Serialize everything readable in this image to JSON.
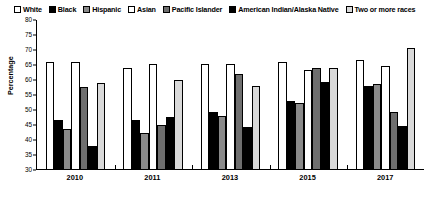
{
  "chart_data": {
    "type": "bar",
    "title": "",
    "xlabel": "",
    "ylabel": "Percentage",
    "ylim": [
      30,
      80
    ],
    "ytick_step": 5,
    "yticks": [
      30,
      35,
      40,
      45,
      50,
      55,
      60,
      65,
      70,
      75,
      80
    ],
    "grid": false,
    "legend_position": "top",
    "categories": [
      "2010",
      "2011",
      "2013",
      "2015",
      "2017"
    ],
    "series": [
      {
        "name": "White",
        "pattern": "open-white",
        "values": [
          65.8,
          63.8,
          64.9,
          65.8,
          66.4
        ]
      },
      {
        "name": "Black",
        "pattern": "solid-black",
        "values": [
          46.2,
          46.4,
          48.9,
          52.6,
          57.8
        ]
      },
      {
        "name": "Hispanic",
        "pattern": "solid-gray",
        "values": [
          43.3,
          42.1,
          47.8,
          52.1,
          58.5
        ]
      },
      {
        "name": "Asian",
        "pattern": "dotted-light",
        "values": [
          65.7,
          65.1,
          65.0,
          62.9,
          64.3
        ]
      },
      {
        "name": "Pacific Islander",
        "pattern": "dotted-dark",
        "values": [
          57.2,
          44.8,
          61.6,
          63.6,
          49.0
        ]
      },
      {
        "name": "American Indian/Alaska Native",
        "pattern": "solid-black",
        "values": [
          37.7,
          47.4,
          44.1,
          59.0,
          44.5
        ]
      },
      {
        "name": "Two or more races",
        "pattern": "dotted-verylight",
        "values": [
          58.8,
          59.6,
          57.6,
          63.7,
          70.3
        ]
      }
    ]
  },
  "legend": {
    "items": [
      {
        "label": "White"
      },
      {
        "label": "Black"
      },
      {
        "label": "Hispanic"
      },
      {
        "label": "Asian"
      },
      {
        "label": "Pacific Islander"
      },
      {
        "label": "American Indian/Alaska Native"
      },
      {
        "label": "Two or more races"
      }
    ]
  },
  "axes": {
    "y_title": "Percentage"
  }
}
